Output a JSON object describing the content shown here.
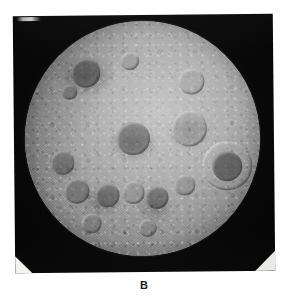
{
  "figure": {
    "caption_label": "B",
    "background_color": "#ffffff"
  },
  "photo_print": {
    "field_color": "#050505",
    "rotation_degrees": -0.55,
    "mark_top_left": "light-scratch-mark"
  },
  "moon": {
    "body_label": "Moon",
    "surface_description": "heavily cratered highland terrain",
    "base_color": "#9d9d9d",
    "highlight_color": "#c3c3c3",
    "shadow_color": "#4f4f4f",
    "craters": [
      {
        "name": "crater-upper-left-dark",
        "cx": 26,
        "cy": 22,
        "r": 6.2,
        "floor": "rgba(70,70,70,0.55)"
      },
      {
        "name": "crater-upper-left-small",
        "cx": 19,
        "cy": 30,
        "r": 3.4,
        "floor": "rgba(88,88,88,0.45)"
      },
      {
        "name": "crater-upper-mid",
        "cx": 45,
        "cy": 17,
        "r": 4.0,
        "floor": "rgba(120,120,120,0.30)"
      },
      {
        "name": "crater-upper-right-ring",
        "cx": 71,
        "cy": 26,
        "r": 5.6,
        "floor": "rgba(130,130,130,0.22)"
      },
      {
        "name": "crater-central-dark",
        "cx": 46,
        "cy": 50,
        "r": 7.0,
        "floor": "rgba(78,78,78,0.52)"
      },
      {
        "name": "crater-right-ring-large",
        "cx": 70,
        "cy": 46,
        "r": 7.6,
        "floor": "rgba(128,128,128,0.20)"
      },
      {
        "name": "crater-right-limb-dark",
        "cx": 86,
        "cy": 62,
        "r": 6.4,
        "floor": "rgba(58,58,58,0.62)"
      },
      {
        "name": "crater-right-limb-halo",
        "cx": 86,
        "cy": 62,
        "r": 10.5,
        "floor": "rgba(0,0,0,0.0)"
      },
      {
        "name": "crater-left-mid",
        "cx": 16,
        "cy": 60,
        "r": 5.0,
        "floor": "rgba(84,84,84,0.46)"
      },
      {
        "name": "crater-left-lower",
        "cx": 22,
        "cy": 72,
        "r": 5.4,
        "floor": "rgba(80,80,80,0.48)"
      },
      {
        "name": "crater-lower-chain-a",
        "cx": 35,
        "cy": 74,
        "r": 5.2,
        "floor": "rgba(76,76,76,0.50)"
      },
      {
        "name": "crater-lower-chain-b",
        "cx": 46,
        "cy": 73,
        "r": 4.8,
        "floor": "rgba(112,112,112,0.30)"
      },
      {
        "name": "crater-lower-chain-c",
        "cx": 56,
        "cy": 75,
        "r": 5.0,
        "floor": "rgba(74,74,74,0.52)"
      },
      {
        "name": "crater-lower-right",
        "cx": 68,
        "cy": 70,
        "r": 4.4,
        "floor": "rgba(108,108,108,0.32)"
      },
      {
        "name": "crater-bottom-left",
        "cx": 28,
        "cy": 86,
        "r": 4.2,
        "floor": "rgba(96,96,96,0.38)"
      },
      {
        "name": "crater-bottom-mid",
        "cx": 52,
        "cy": 88,
        "r": 3.8,
        "floor": "rgba(104,104,104,0.34)"
      }
    ]
  },
  "photo_corners": {
    "bottom_left_label": "photo-corner-mount",
    "bottom_right_label": "photo-corner-mount",
    "color": "#f2f2f0"
  }
}
